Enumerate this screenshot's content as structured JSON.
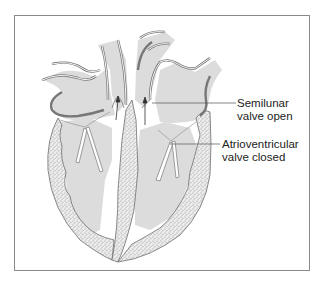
{
  "diagram": {
    "labels": [
      {
        "id": "semilunar",
        "line1": "Semilunar",
        "line2": "valve open"
      },
      {
        "id": "atrioventricular",
        "line1": "Atrioventricular",
        "line2": "valve closed"
      }
    ],
    "colors": {
      "chamber_fill": "#dcdcdc",
      "muscle_fill": "#e8e8e8",
      "muscle_stipple": "#8c8c8c",
      "outline": "#6e6e6e",
      "frame": "#8a8a8a",
      "valve_leaflet": "#ffffff"
    },
    "arrows": [
      "pulmonary-outflow-arrow",
      "aortic-outflow-arrow"
    ]
  }
}
